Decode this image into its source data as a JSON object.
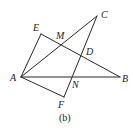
{
  "figure": {
    "caption": "(b)",
    "line_color": "#2a2a2a",
    "points": {
      "A": {
        "label": "A",
        "x": 21,
        "y": 77
      },
      "E": {
        "label": "E",
        "x": 41,
        "y": 34
      },
      "M": {
        "label": "M",
        "x": 59,
        "y": 44
      },
      "C": {
        "label": "C",
        "x": 97,
        "y": 16
      },
      "D": {
        "label": "D",
        "x": 82,
        "y": 57
      },
      "B": {
        "label": "B",
        "x": 120,
        "y": 77
      },
      "N": {
        "label": "N",
        "x": 73,
        "y": 77
      },
      "F": {
        "label": "F",
        "x": 64,
        "y": 97
      }
    },
    "segments": [
      {
        "from": "A",
        "to": "E"
      },
      {
        "from": "E",
        "to": "B"
      },
      {
        "from": "A",
        "to": "C"
      },
      {
        "from": "C",
        "to": "F"
      },
      {
        "from": "A",
        "to": "B"
      },
      {
        "from": "A",
        "to": "F"
      }
    ]
  }
}
